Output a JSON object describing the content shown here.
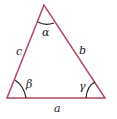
{
  "diagram": {
    "type": "triangle",
    "stroke_color": "#b0485f",
    "arc_color": "#222222",
    "vertices": {
      "top": [
        44,
        5
      ],
      "bottom_left": [
        7,
        98
      ],
      "bottom_right": [
        105,
        98
      ]
    },
    "sides": {
      "a": "a",
      "b": "b",
      "c": "c"
    },
    "angles": {
      "alpha": "α",
      "beta": "β",
      "gamma": "γ"
    }
  }
}
